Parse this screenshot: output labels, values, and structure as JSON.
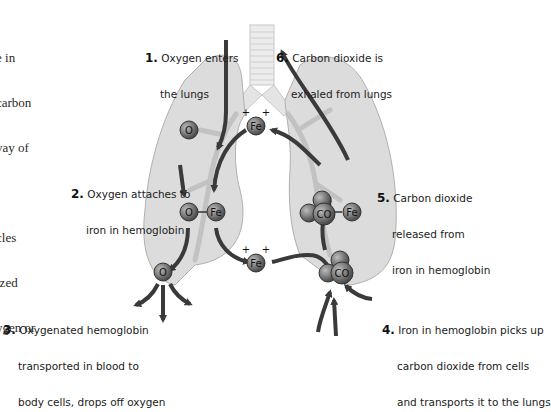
{
  "left_partial_text": {
    "lines": [
      "e in",
      "carbon",
      "vay of",
      "",
      "cles",
      "ized",
      "ygen or"
    ]
  },
  "steps": [
    {
      "number": "1.",
      "lines": [
        "Oxygen enters",
        "the lungs"
      ]
    },
    {
      "number": "2.",
      "lines": [
        "Oxygen attaches to",
        "iron in hemoglobin"
      ]
    },
    {
      "number": "3.",
      "lines": [
        "Oxygenated hemoglobin",
        "transported in blood to",
        "body cells, drops off oxygen"
      ]
    },
    {
      "number": "4.",
      "lines": [
        "Iron in hemoglobin picks up",
        "carbon dioxide from cells",
        "and transports it to the lungs"
      ]
    },
    {
      "number": "5.",
      "lines": [
        "Carbon dioxide",
        "released from",
        "iron in hemoglobin"
      ]
    },
    {
      "number": "6.",
      "lines": [
        "Carbon dioxide is",
        "exhaled from lungs"
      ]
    }
  ],
  "molecules": {
    "oxygen": "O",
    "iron": "Fe",
    "charge": "+",
    "co2": "CO"
  },
  "colors": {
    "lung_fill": "#dcdcdc",
    "lung_stroke": "#b0b0b0",
    "arrow": "#3a3a3a",
    "atom": "#6a6a6a",
    "trachea": "#e8e8e8"
  }
}
